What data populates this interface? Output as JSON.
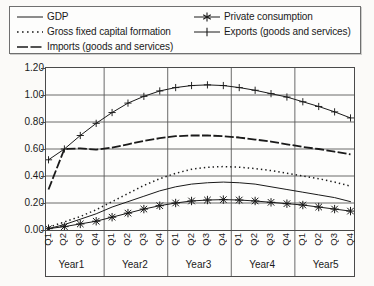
{
  "chart_data": {
    "type": "line",
    "title": "",
    "xlabel": "",
    "ylabel": "",
    "ylim": [
      0.0,
      1.2
    ],
    "ytick_step": 0.2,
    "ytick_labels": [
      "1.20",
      "1.00",
      "0.80",
      "0.60",
      "0.40",
      "0.20",
      "0.00"
    ],
    "ytick_values": [
      1.2,
      1.0,
      0.8,
      0.6,
      0.4,
      0.2,
      0.0
    ],
    "grid": true,
    "grid_axis": "y",
    "legend_position": "top",
    "legend_columns": 2,
    "x": [
      "Q1",
      "Q2",
      "Q3",
      "Q4",
      "Q1",
      "Q2",
      "Q3",
      "Q4",
      "Q1",
      "Q2",
      "Q3",
      "Q4",
      "Q1",
      "Q2",
      "Q3",
      "Q4",
      "Q1",
      "Q2",
      "Q3",
      "Q4"
    ],
    "quarter_labels": [
      "Q1",
      "Q2",
      "Q3",
      "Q4"
    ],
    "year_groups": [
      "Year1",
      "Year2",
      "Year3",
      "Year4",
      "Year5"
    ],
    "series": [
      {
        "name": "GDP",
        "style": "solid-thin",
        "marker": "none",
        "color": "#1a1a1a",
        "values": [
          0.01,
          0.04,
          0.08,
          0.12,
          0.17,
          0.21,
          0.25,
          0.29,
          0.32,
          0.34,
          0.35,
          0.355,
          0.35,
          0.34,
          0.32,
          0.3,
          0.28,
          0.26,
          0.24,
          0.21
        ]
      },
      {
        "name": "Gross fixed capital formation",
        "style": "dotted",
        "marker": "none",
        "color": "#1a1a1a",
        "values": [
          0.02,
          0.06,
          0.1,
          0.15,
          0.21,
          0.27,
          0.33,
          0.38,
          0.42,
          0.45,
          0.465,
          0.47,
          0.465,
          0.455,
          0.44,
          0.42,
          0.4,
          0.38,
          0.355,
          0.325
        ]
      },
      {
        "name": "Imports (goods and services)",
        "style": "dashed-thick",
        "marker": "none",
        "color": "#1a1a1a",
        "values": [
          0.3,
          0.6,
          0.605,
          0.595,
          0.61,
          0.635,
          0.66,
          0.68,
          0.695,
          0.7,
          0.7,
          0.695,
          0.685,
          0.67,
          0.655,
          0.635,
          0.615,
          0.6,
          0.58,
          0.56
        ]
      },
      {
        "name": "Private consumption",
        "style": "solid-thin",
        "marker": "asterisk",
        "color": "#1a1a1a",
        "values": [
          0.01,
          0.025,
          0.045,
          0.065,
          0.095,
          0.125,
          0.155,
          0.18,
          0.2,
          0.215,
          0.222,
          0.225,
          0.222,
          0.215,
          0.205,
          0.195,
          0.185,
          0.17,
          0.155,
          0.14
        ]
      },
      {
        "name": "Exports (goods and services)",
        "style": "solid-thin",
        "marker": "plus",
        "color": "#1a1a1a",
        "values": [
          0.52,
          0.6,
          0.7,
          0.79,
          0.87,
          0.94,
          0.99,
          1.03,
          1.055,
          1.07,
          1.075,
          1.07,
          1.055,
          1.035,
          1.01,
          0.985,
          0.95,
          0.915,
          0.875,
          0.83
        ]
      }
    ]
  },
  "legend": {
    "left_column": [
      {
        "label": "GDP",
        "marker": "line-solid-thin"
      },
      {
        "label": "Gross fixed capital formation",
        "marker": "line-dotted"
      },
      {
        "label": "Imports (goods and services)",
        "marker": "line-dashed-thick"
      }
    ],
    "right_column": [
      {
        "label": "Private consumption",
        "marker": "line-asterisk"
      },
      {
        "label": "Exports (goods and services)",
        "marker": "line-plus"
      }
    ]
  }
}
